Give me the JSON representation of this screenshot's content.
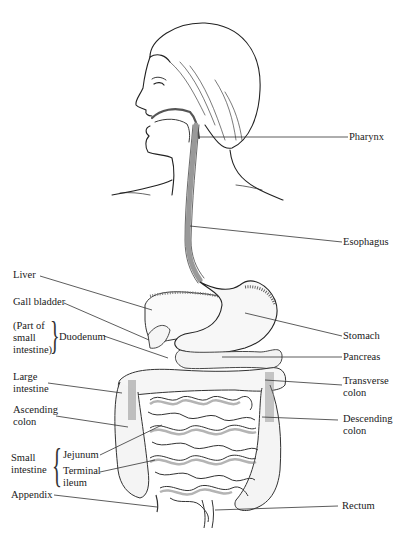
{
  "diagram": {
    "line_color": "#222222",
    "shade_color": "#777777",
    "labels_right": {
      "pharynx": "Pharynx",
      "esophagus": "Esophagus",
      "stomach": "Stomach",
      "pancreas": "Pancreas",
      "transverse_colon_1": "Transverse",
      "transverse_colon_2": "colon",
      "descending_colon_1": "Descending",
      "descending_colon_2": "colon",
      "rectum": "Rectum"
    },
    "labels_left": {
      "liver": "Liver",
      "gall_bladder": "Gall bladder",
      "part_of_1": "(Part of",
      "part_of_2": "small",
      "part_of_3": "intestine)",
      "duodenum": "Duodenum",
      "large_intestine_1": "Large",
      "large_intestine_2": "intestine",
      "ascending_colon_1": "Ascending",
      "ascending_colon_2": "colon",
      "small_intestine_1": "Small",
      "small_intestine_2": "intestine",
      "jejunum": "Jejunum",
      "terminal_ileum_1": "Terminal",
      "terminal_ileum_2": "ileum",
      "appendix": "Appendix"
    }
  }
}
